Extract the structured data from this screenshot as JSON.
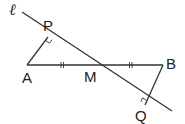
{
  "diagram": {
    "type": "geometry",
    "line_label": "ℓ",
    "points": {
      "A": {
        "label": "A",
        "x": 27,
        "y": 65
      },
      "M": {
        "label": "M",
        "x": 95,
        "y": 65
      },
      "B": {
        "label": "B",
        "x": 163,
        "y": 65
      },
      "P": {
        "label": "P",
        "x": 48,
        "y": 37
      },
      "Q": {
        "label": "Q",
        "x": 145,
        "y": 105
      }
    },
    "segments": [
      "AB",
      "AP",
      "BQ",
      "line ℓ through P, M, Q"
    ],
    "marks": {
      "equal_ticks": [
        "AM",
        "MB"
      ],
      "right_angles": [
        "P",
        "Q"
      ]
    },
    "colors": {
      "stroke": "#333333",
      "text": "#222222"
    }
  }
}
